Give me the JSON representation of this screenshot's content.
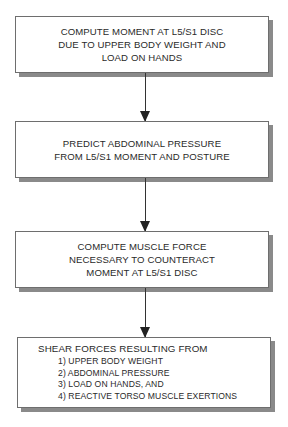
{
  "flowchart": {
    "steps": [
      {
        "lines": [
          "COMPUTE MOMENT AT L5/S1 DISC",
          "DUE TO UPPER BODY WEIGHT AND",
          "LOAD ON HANDS"
        ]
      },
      {
        "lines": [
          "PREDICT ABDOMINAL PRESSURE",
          "FROM L5/S1 MOMENT AND POSTURE"
        ]
      },
      {
        "lines": [
          "COMPUTE MUSCLE FORCE",
          "NECESSARY TO COUNTERACT",
          "MOMENT AT L5/S1 DISC"
        ]
      },
      {
        "heading": "SHEAR FORCES RESULTING FROM",
        "items": [
          "1) UPPER BODY WEIGHT",
          "2) ABDOMINAL PRESSURE",
          "3) LOAD ON HANDS, AND",
          "4) REACTIVE TORSO MUSCLE EXERTIONS"
        ]
      }
    ],
    "connectors": [
      "step1-to-step2",
      "step2-to-step3",
      "step3-to-step4"
    ]
  },
  "colors": {
    "box_border": "#6e6e6e",
    "box_shadow": "#8a8a8a",
    "arrow": "#222222",
    "text": "#2a2a2a"
  }
}
